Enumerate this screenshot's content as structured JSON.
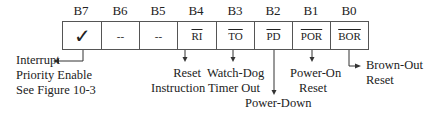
{
  "register": {
    "bits": [
      {
        "name": "B7",
        "content": "✓",
        "overline": false
      },
      {
        "name": "B6",
        "content": "--",
        "overline": false
      },
      {
        "name": "B5",
        "content": "--",
        "overline": false
      },
      {
        "name": "B4",
        "content": "RI",
        "overline": true
      },
      {
        "name": "B3",
        "content": "TO",
        "overline": true
      },
      {
        "name": "B2",
        "content": "PD",
        "overline": true
      },
      {
        "name": "B1",
        "content": "POR",
        "overline": true
      },
      {
        "name": "B0",
        "content": "BOR",
        "overline": true
      }
    ]
  },
  "annotations": {
    "b7": {
      "line1": "Interrupt",
      "line2": "Priority Enable",
      "line3": "See Figure 10-3"
    },
    "b4": {
      "line1": "Reset",
      "line2": "Instruction"
    },
    "b3": {
      "line1": "Watch-Dog",
      "line2": "Timer Out"
    },
    "b2": {
      "line1": "Power-Down"
    },
    "b1": {
      "line1": "Power-On",
      "line2": "Reset"
    },
    "b0": {
      "line1": "Brown-Out",
      "line2": "Reset"
    }
  }
}
